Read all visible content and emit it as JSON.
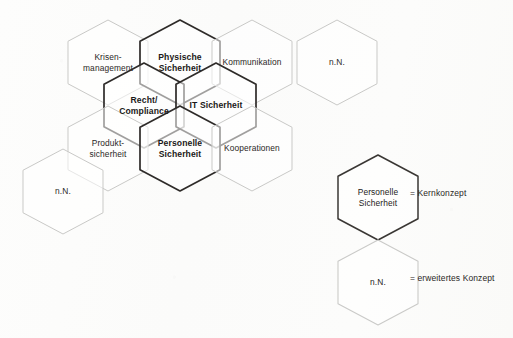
{
  "diagram": {
    "colors": {
      "background": "#fdfdfc",
      "core_stroke": "#2e2b29",
      "ext_stroke": "#c9c9c7",
      "legend_core_stroke": "#3a3734",
      "legend_ext_stroke": "#cacac8",
      "text": "#23201f"
    },
    "hexagons": [
      {
        "id": "krisenmanagement",
        "label": "Krisen-\nmanagement",
        "type": "ext",
        "x": 68,
        "y": 20
      },
      {
        "id": "physische-sicherheit",
        "label": "Physische\nSicherheit",
        "type": "core",
        "x": 140,
        "y": 20
      },
      {
        "id": "kommunikation",
        "label": "Kommunikation",
        "type": "ext",
        "x": 212,
        "y": 20
      },
      {
        "id": "nn-top-right",
        "label": "n.N.",
        "type": "ext",
        "x": 297,
        "y": 20
      },
      {
        "id": "recht-compliance",
        "label": "Recht/\nCompliance",
        "type": "core",
        "x": 104,
        "y": 63
      },
      {
        "id": "it-sicherheit",
        "label": "IT Sicherheit",
        "type": "core",
        "x": 176,
        "y": 63
      },
      {
        "id": "produktsicherheit",
        "label": "Produkt-\nsicherheit",
        "type": "ext",
        "x": 68,
        "y": 106
      },
      {
        "id": "personelle-sicherheit",
        "label": "Personelle\nSicherheit",
        "type": "core",
        "x": 140,
        "y": 106
      },
      {
        "id": "kooperationen",
        "label": "Kooperationen",
        "type": "ext",
        "x": 212,
        "y": 106
      },
      {
        "id": "nn-bottom-left",
        "label": "n.N.",
        "type": "ext",
        "x": 23,
        "y": 149
      }
    ],
    "legend": {
      "items": [
        {
          "id": "legend-kernkonzept",
          "hex_label": "Personelle\nSicherheit",
          "hex_type": "legend-core",
          "text": "= Kernkonzept",
          "hex_x": 338,
          "hex_y": 155,
          "text_x": 410,
          "text_y": 188
        },
        {
          "id": "legend-erweitertes-konzept",
          "hex_label": "n.N.",
          "hex_type": "legend-ext",
          "text": "= erweitertes Konzept",
          "hex_x": 338,
          "hex_y": 240,
          "text_x": 410,
          "text_y": 273
        }
      ]
    }
  },
  "hex_geometry": {
    "width": 80,
    "height": 85,
    "note": "pointy-top hexagon"
  }
}
